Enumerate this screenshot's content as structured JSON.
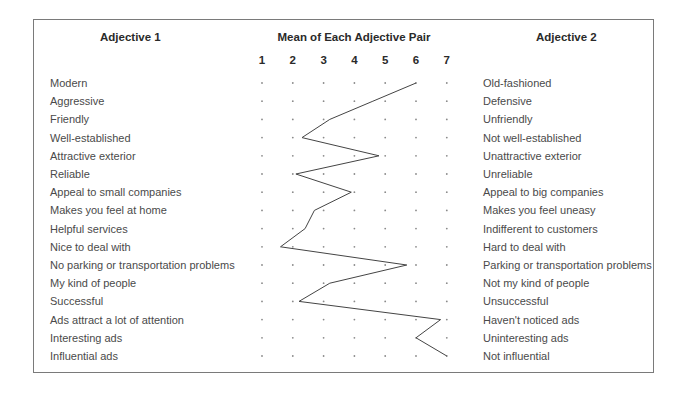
{
  "header": {
    "left_title": "Adjective 1",
    "center_title": "Mean of Each Adjective Pair",
    "right_title": "Adjective 2",
    "scale": [
      "1",
      "2",
      "3",
      "4",
      "5",
      "6",
      "7"
    ]
  },
  "rows": [
    {
      "left": "Modern",
      "right": "Old-fashioned",
      "mean": 6.0
    },
    {
      "left": "Aggressive",
      "right": "Defensive",
      "mean": 4.6
    },
    {
      "left": "Friendly",
      "right": "Unfriendly",
      "mean": 3.2
    },
    {
      "left": "Well-established",
      "right": "Not well-established",
      "mean": 2.3
    },
    {
      "left": "Attractive exterior",
      "right": "Unattractive exterior",
      "mean": 4.8
    },
    {
      "left": "Reliable",
      "right": "Unreliable",
      "mean": 2.1
    },
    {
      "left": "Appeal to small companies",
      "right": "Appeal to big companies",
      "mean": 3.9
    },
    {
      "left": "Makes you feel at home",
      "right": "Makes you feel uneasy",
      "mean": 2.7
    },
    {
      "left": "Helpful services",
      "right": "Indifferent to customers",
      "mean": 2.4
    },
    {
      "left": "Nice to deal with",
      "right": "Hard to deal with",
      "mean": 1.6
    },
    {
      "left": "No parking or transportation problems",
      "right": "Parking or transportation problems",
      "mean": 5.7
    },
    {
      "left": "My kind of people",
      "right": "Not my kind of people",
      "mean": 3.2
    },
    {
      "left": "Successful",
      "right": "Unsuccessful",
      "mean": 2.2
    },
    {
      "left": "Ads attract a lot of attention",
      "right": "Haven't noticed ads",
      "mean": 6.8
    },
    {
      "left": "Interesting ads",
      "right": "Uninteresting ads",
      "mean": 6.0
    },
    {
      "left": "Influential ads",
      "right": "Not influential",
      "mean": 7.0
    }
  ],
  "chart_data": {
    "type": "line",
    "title": "Mean of Each Adjective Pair",
    "subtype": "semantic differential profile",
    "xlabel": "Mean (1 = Adjective 1, 7 = Adjective 2)",
    "xlim": [
      1,
      7
    ],
    "x_ticks": [
      1,
      2,
      3,
      4,
      5,
      6,
      7
    ],
    "categories": [
      "Modern / Old-fashioned",
      "Aggressive / Defensive",
      "Friendly / Unfriendly",
      "Well-established / Not well-established",
      "Attractive exterior / Unattractive exterior",
      "Reliable / Unreliable",
      "Appeal to small companies / Appeal to big companies",
      "Makes you feel at home / Makes you feel uneasy",
      "Helpful services / Indifferent to customers",
      "Nice to deal with / Hard to deal with",
      "No parking or transportation problems / Parking or transportation problems",
      "My kind of people / Not my kind of people",
      "Successful / Unsuccessful",
      "Ads attract a lot of attention / Haven't noticed ads",
      "Interesting ads / Uninteresting ads",
      "Influential ads / Not influential"
    ],
    "values": [
      6.0,
      4.6,
      3.2,
      2.3,
      4.8,
      2.1,
      3.9,
      2.7,
      2.4,
      1.6,
      5.7,
      3.2,
      2.2,
      6.8,
      6.0,
      7.0
    ],
    "grid": "dot grid",
    "legend": "none"
  },
  "style": {
    "line_color": "#444444",
    "dot_color": "#8a8a8a",
    "border_color": "#7a7a7a"
  }
}
